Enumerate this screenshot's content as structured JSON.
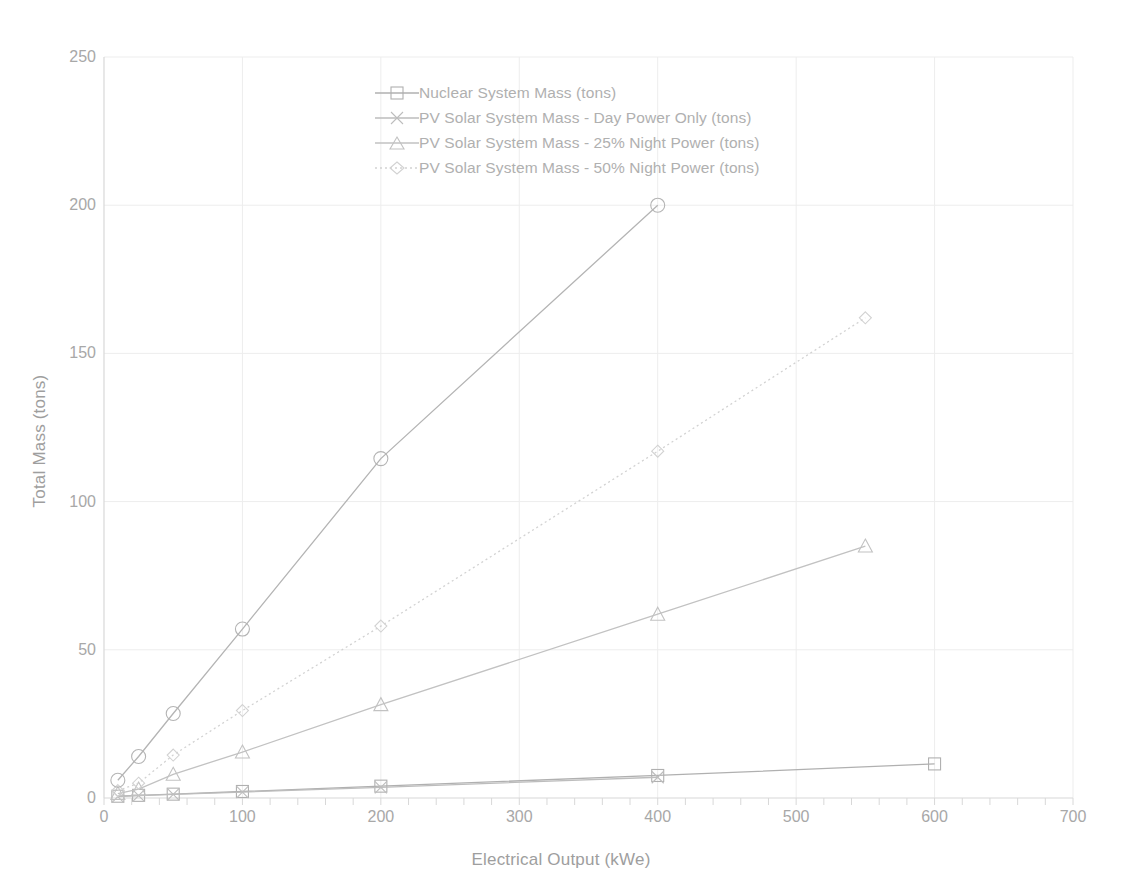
{
  "chart_data": {
    "type": "line",
    "title": "",
    "xlabel": "Electrical Output (kWe)",
    "ylabel": "Total Mass (tons)",
    "xlim": [
      0,
      700
    ],
    "ylim": [
      0,
      250
    ],
    "xticks": [
      0,
      100,
      200,
      300,
      400,
      500,
      600,
      700
    ],
    "yticks": [
      0,
      50,
      100,
      150,
      200,
      250
    ],
    "xtick_labels": [
      "0",
      "100",
      "200",
      "300",
      "400",
      "500",
      "600",
      "700"
    ],
    "ytick_labels": [
      "0",
      "50",
      "100",
      "150",
      "200",
      "250"
    ],
    "x_minor_tick_step": 20,
    "grid": true,
    "legend_position": "upper center",
    "series": [
      {
        "name": "Nuclear System Mass (tons)",
        "marker": "square",
        "line_style": "solid",
        "color": "#b0b0b0",
        "x": [
          10,
          25,
          50,
          100,
          200,
          400,
          600
        ],
        "y": [
          0.6,
          0.9,
          1.3,
          2.2,
          4.0,
          7.6,
          11.5
        ]
      },
      {
        "name": "PV Solar System Mass - Day Power Only (tons)",
        "marker": "x",
        "line_style": "solid",
        "color": "#bdbdbd",
        "x": [
          10,
          25,
          50,
          100,
          200,
          400
        ],
        "y": [
          0.5,
          0.8,
          1.2,
          2.0,
          3.6,
          7.0
        ]
      },
      {
        "name": "PV Solar System Mass - 25% Night Power (tons)",
        "marker": "triangle",
        "line_style": "solid",
        "color": "#c2c2c2",
        "x": [
          10,
          25,
          50,
          100,
          200,
          400,
          550
        ],
        "y": [
          1.5,
          3.0,
          8.0,
          15.5,
          31.5,
          62.0,
          85.0
        ]
      },
      {
        "name": "PV Solar System Mass - 50% Night Power (tons)",
        "marker": "diamond",
        "line_style": "dotted",
        "color": "#d2d2d2",
        "x": [
          10,
          25,
          50,
          100,
          200,
          400,
          550
        ],
        "y": [
          2.5,
          5.0,
          14.5,
          29.5,
          58.0,
          117.0,
          162.0
        ]
      },
      {
        "name": "PV Solar Day Power Upper Curve",
        "marker": "circle",
        "line_style": "solid",
        "color": "#b4b4b4",
        "x": [
          10,
          25,
          50,
          100,
          200,
          400
        ],
        "y": [
          6.0,
          14.0,
          28.5,
          57.0,
          114.5,
          200.0
        ]
      }
    ]
  },
  "legend": {
    "items": [
      {
        "label": "Nuclear System Mass (tons)",
        "marker": "square-marker-icon"
      },
      {
        "label": "PV Solar System Mass - Day Power Only (tons)",
        "marker": "x-marker-icon"
      },
      {
        "label": "PV Solar System Mass - 25% Night Power (tons)",
        "marker": "triangle-marker-icon"
      },
      {
        "label": "PV Solar System Mass - 50% Night Power (tons)",
        "marker": "diamond-marker-icon"
      }
    ]
  },
  "colors": {
    "grid": "#ededed",
    "axis": "#d8d8d8",
    "text": "#a8a8a8"
  }
}
